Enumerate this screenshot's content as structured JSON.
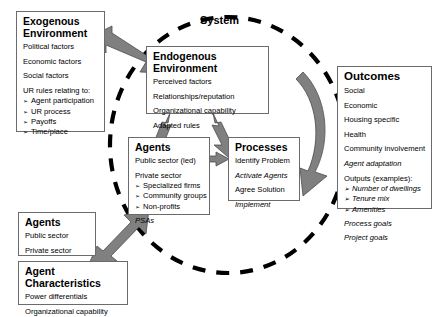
{
  "diagram": {
    "system_label": "System",
    "boxes": {
      "exogenous": {
        "title": "Exogenous\nEnvironment",
        "lines": [
          "Political factors",
          "Economic factors",
          "Social factors",
          "UR rules relating to:"
        ],
        "bullets": [
          "Agent participation",
          "UR process",
          "Payoffs",
          "Time/place"
        ]
      },
      "endogenous": {
        "title": "Endogenous Environment",
        "lines": [
          "Perceived factors",
          "Relationships/reputation",
          "Organizational capability",
          "Adapted rules"
        ]
      },
      "agents_center": {
        "title": "Agents",
        "line_led": "Public sector (led)",
        "line_private": "Private sector",
        "bullets": [
          "Specialized firms",
          "Community groups",
          "Non-profits"
        ],
        "line_psas": "PSAs"
      },
      "processes": {
        "title": "Processes",
        "lines": [
          "Identify Problem",
          "Activate Agents",
          "Agree Solution",
          "Implement"
        ],
        "italic_flags": [
          false,
          true,
          false,
          true
        ]
      },
      "outcomes": {
        "title": "Outcomes",
        "lines": [
          "Social",
          "Economic",
          "Housing specific",
          "Health",
          "Community involvement"
        ],
        "line_agent_adaptation": "Agent adaptation",
        "line_outputs": "Outputs (examples):",
        "bullets": [
          "Number of dwellings",
          "Tenure mix",
          "Amenities"
        ],
        "line_process_goals": "Process goals",
        "line_project_goals": "Project goals"
      },
      "agents_bottom": {
        "title": "Agents",
        "lines": [
          "Public sector",
          "Private sector"
        ]
      },
      "agent_characteristics": {
        "title": "Agent Characteristics",
        "lines": [
          "Power differentials",
          "Organizational capability"
        ]
      }
    },
    "colors": {
      "arrow_fill": "#808080",
      "arrow_stroke": "#4d4d4d",
      "box_border": "#6b6b6b",
      "dashed_circle": "#000000",
      "text": "#000000",
      "background": "#ffffff"
    },
    "arrows": [
      {
        "name": "exogenous-endogenous",
        "type": "double-headed-diagonal"
      },
      {
        "name": "endogenous-agents",
        "type": "double-headed-diagonal"
      },
      {
        "name": "endogenous-processes",
        "type": "double-headed-diagonal"
      },
      {
        "name": "agents-processes",
        "type": "double-headed-horizontal"
      },
      {
        "name": "processes-outcomes",
        "type": "curved-single-headed"
      },
      {
        "name": "agent-characteristics-agents",
        "type": "double-headed-diagonal"
      }
    ]
  }
}
